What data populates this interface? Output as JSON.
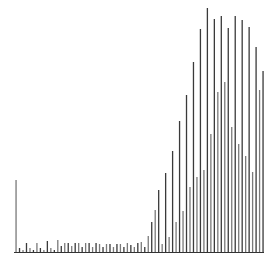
{
  "chart_data": {
    "type": "bar",
    "title": "",
    "xlabel": "",
    "ylabel": "",
    "grid": false,
    "legend": null,
    "bar_color": "#3a3a3a",
    "bar_color_alt": "#7a7a7a",
    "axis_color": "#333333",
    "x": [
      0,
      1,
      2,
      3,
      4,
      5,
      6,
      7,
      8,
      9,
      10,
      11,
      12,
      13,
      14,
      15,
      16,
      17,
      18,
      19,
      20,
      21,
      22,
      23,
      24,
      25,
      26,
      27,
      28,
      29,
      30,
      31,
      32,
      33,
      34,
      35,
      36,
      37,
      38,
      39,
      40,
      41,
      42,
      43,
      44,
      45,
      46,
      47,
      48,
      49,
      50,
      51,
      52,
      53,
      54,
      55,
      56,
      57,
      58,
      59,
      60,
      61,
      62,
      63,
      64,
      65,
      66,
      67,
      68,
      69,
      70,
      71
    ],
    "values": [
      72,
      4,
      2,
      9,
      4,
      2,
      9,
      4,
      2,
      11,
      4,
      2,
      12,
      6,
      9,
      9,
      6,
      9,
      9,
      5,
      9,
      9,
      5,
      9,
      8,
      5,
      8,
      8,
      5,
      8,
      8,
      5,
      9,
      7,
      5,
      9,
      10,
      5,
      16,
      30,
      42,
      62,
      8,
      79,
      15,
      101,
      30,
      131,
      41,
      157,
      65,
      190,
      75,
      223,
      82,
      244,
      118,
      233,
      160,
      236,
      170,
      224,
      125,
      236,
      108,
      232,
      96,
      225,
      80,
      205,
      162,
      181
    ]
  }
}
